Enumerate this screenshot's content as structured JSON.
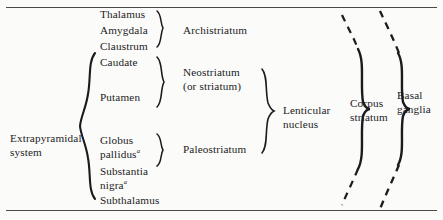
{
  "figure": {
    "background_color": "#fbfbfa",
    "ink_color": "#1b1b1d",
    "rule_color": "#4a4a4a"
  },
  "column_system": {
    "label": "Extrapyramidal system"
  },
  "structures": [
    {
      "id": "thalamus",
      "label": "Thalamus",
      "superscript": ""
    },
    {
      "id": "amygdala",
      "label": "Amygdala",
      "superscript": ""
    },
    {
      "id": "claustrum",
      "label": "Claustrum",
      "superscript": ""
    },
    {
      "id": "caudate",
      "label": "Caudate",
      "superscript": ""
    },
    {
      "id": "putamen",
      "label": "Putamen",
      "superscript": ""
    },
    {
      "id": "globus",
      "label": "Globus",
      "superscript": ""
    },
    {
      "id": "pallidus",
      "label": "pallidus",
      "superscript": "a"
    },
    {
      "id": "substantia",
      "label": "Substantia",
      "superscript": ""
    },
    {
      "id": "nigra",
      "label": "nigra",
      "superscript": "a"
    },
    {
      "id": "subthalamus",
      "label": "Subthalamus",
      "superscript": ""
    }
  ],
  "groups_striatal": [
    {
      "id": "archistriatum",
      "line1": "Archistriatum",
      "line2": ""
    },
    {
      "id": "neostriatum",
      "line1": "Neostriatum",
      "line2": "(or striatum)"
    },
    {
      "id": "paleostriatum",
      "line1": "Paleostriatum",
      "line2": ""
    }
  ],
  "groups_aggregate": [
    {
      "id": "lenticular-nucleus",
      "line1": "Lenticular",
      "line2": "nucleus"
    },
    {
      "id": "corpus-striatum",
      "line1": "Corpus",
      "line2": "striatum"
    },
    {
      "id": "basal-ganglia",
      "line1": "Basal",
      "line2": "ganglia"
    }
  ]
}
